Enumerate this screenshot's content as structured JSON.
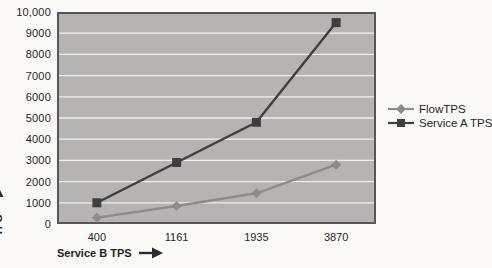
{
  "chart_data": {
    "type": "line",
    "categories": [
      "400",
      "1161",
      "1935",
      "3870"
    ],
    "series": [
      {
        "name": "FlowTPS",
        "values": [
          300,
          850,
          1450,
          2800
        ],
        "color": "#8c8c8a",
        "marker": "diamond"
      },
      {
        "name": "Service A TPS",
        "values": [
          1000,
          2900,
          4800,
          9500
        ],
        "color": "#3e3e40",
        "marker": "square"
      }
    ],
    "title": "",
    "xlabel": "Service B TPS",
    "ylabel": "TPS",
    "ylim": [
      0,
      10000
    ],
    "ytick_interval": 1000,
    "ytick_labels": [
      "0",
      "1000",
      "2000",
      "3000",
      "4000",
      "5000",
      "6000",
      "7000",
      "8000",
      "9000",
      "10,000"
    ],
    "grid": true,
    "legend_position": "right",
    "plot_background": "#b5b4b2",
    "gridline_color": "#f0efec",
    "border_color": "#57555a",
    "arrow_color": "#2b2a2e"
  }
}
